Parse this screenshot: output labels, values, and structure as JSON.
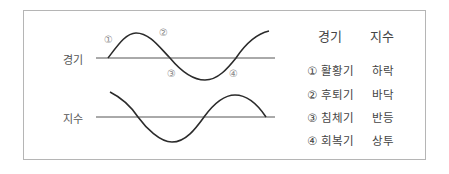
{
  "diagram": {
    "rows": [
      {
        "label": "경기"
      },
      {
        "label": "지수"
      }
    ],
    "markers": [
      "①",
      "②",
      "③",
      "④"
    ]
  },
  "legend": {
    "headers": {
      "col1": "경기",
      "col2": "지수"
    },
    "rows": [
      {
        "phase": "① 활황기",
        "index": "하락"
      },
      {
        "phase": "② 후퇴기",
        "index": "바닥"
      },
      {
        "phase": "③ 침체기",
        "index": "반등"
      },
      {
        "phase": "④ 회복기",
        "index": "상투"
      }
    ]
  },
  "colors": {
    "line": "#2b2b2b",
    "axis": "#555555",
    "border": "#b5b5b5",
    "marker": "#888888"
  }
}
